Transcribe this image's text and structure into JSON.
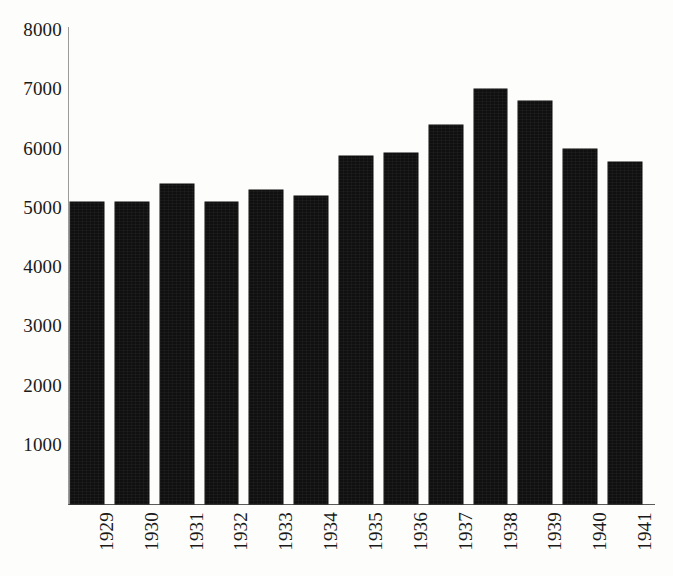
{
  "chart_data": {
    "type": "bar",
    "title": "",
    "subtitle": "",
    "xlabel": "",
    "ylabel": "",
    "categories": [
      "1929",
      "1930",
      "1931",
      "1932",
      "1933",
      "1934",
      "1935",
      "1936",
      "1937",
      "1938",
      "1939",
      "1940",
      "1941"
    ],
    "values": [
      5100,
      5100,
      5400,
      5100,
      5300,
      5200,
      5880,
      5920,
      6400,
      7000,
      6800,
      6000,
      5780
    ],
    "ylim": [
      0,
      8000
    ],
    "yticks": [
      1000,
      2000,
      3000,
      4000,
      5000,
      6000,
      7000,
      8000
    ],
    "ytick_labels": [
      "1000",
      "2000",
      "3000",
      "4000",
      "5000",
      "6000",
      "7000",
      "8000"
    ],
    "grid": false,
    "legend": null,
    "legend_position": "none",
    "bar_color": "#111010",
    "background_color": "#fdfdfb",
    "axis_color": "#5a5a5a",
    "text_color": "#1a1a1a",
    "xtick_rotation": 90,
    "annotations": []
  }
}
